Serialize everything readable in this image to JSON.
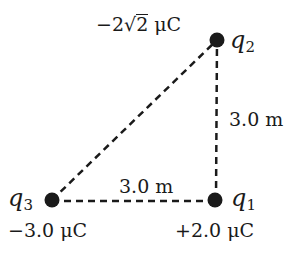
{
  "diagram": {
    "type": "charge-triangle",
    "charges": [
      {
        "id": "q1",
        "symbol": "q",
        "subscript": "1",
        "value": "+2.0 μC",
        "position": "bottom-right"
      },
      {
        "id": "q2",
        "symbol": "q",
        "subscript": "2",
        "value_prefix": "−2",
        "value_radical": "2",
        "value_unit": " μC",
        "value": "−2√2 μC",
        "position": "top-right"
      },
      {
        "id": "q3",
        "symbol": "q",
        "subscript": "3",
        "value": "−3.0 μC",
        "position": "bottom-left"
      }
    ],
    "distances": [
      {
        "between": [
          "q1",
          "q2"
        ],
        "label": "3.0 m"
      },
      {
        "between": [
          "q3",
          "q1"
        ],
        "label": "3.0 m"
      }
    ],
    "colors": {
      "ink": "#1a1a1a",
      "background": "#ffffff"
    }
  }
}
